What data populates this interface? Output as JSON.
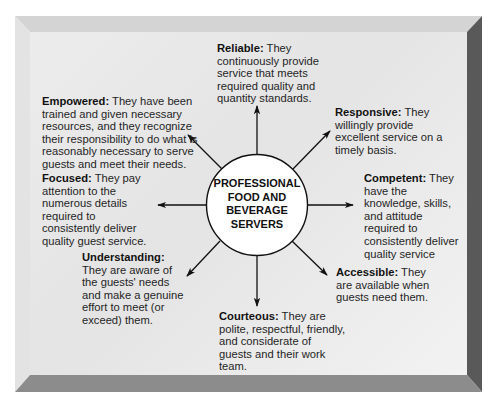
{
  "diagram": {
    "center": {
      "lines": [
        "PROFESSIONAL",
        "FOOD AND",
        "BEVERAGE",
        "SERVERS"
      ]
    },
    "qualities": [
      {
        "key": "reliable",
        "term": "Reliable:",
        "description": "They continuously provide service that meets required quality and quantity standards.",
        "direction": "up"
      },
      {
        "key": "responsive",
        "term": "Responsive:",
        "description": "They willingly provide excellent service on a timely basis.",
        "direction": "up-right"
      },
      {
        "key": "competent",
        "term": "Competent:",
        "description": "They have the knowledge, skills, and attitude required to consistently deliver quality service",
        "direction": "right"
      },
      {
        "key": "accessible",
        "term": "Accessible:",
        "description": "They are available when guests need them.",
        "direction": "down-right"
      },
      {
        "key": "courteous",
        "term": "Courteous:",
        "description": "They are polite, respectful, friendly, and considerate of guests and their work team.",
        "direction": "down"
      },
      {
        "key": "understanding",
        "term": "Understanding:",
        "description": "They are aware of the guests' needs and make a genuine effort to meet (or exceed) them.",
        "direction": "down-left"
      },
      {
        "key": "focused",
        "term": "Focused:",
        "description": "They pay attention to the numerous details required to consistently deliver quality guest service.",
        "direction": "left"
      },
      {
        "key": "empowered",
        "term": "Empowered:",
        "description": "They have been trained and given necessary resources, and they recognize their responsibility to do what is reasonably necessary to serve guests and meet their needs.",
        "direction": "up-left"
      }
    ],
    "colors": {
      "panel": "#e8e8e8",
      "bevel_top": "#d6d6d6",
      "bevel_left": "#e2e2e2",
      "bevel_right": "#5a5a5a",
      "bevel_bottom": "#8a8a8a",
      "ink": "#111111"
    }
  }
}
